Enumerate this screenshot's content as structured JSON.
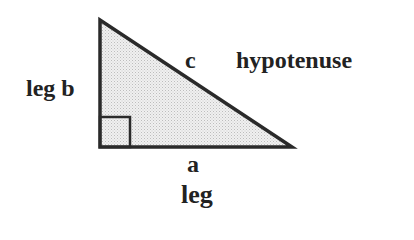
{
  "diagram": {
    "labels": {
      "side_b": "leg b",
      "side_c": "c",
      "hypotenuse": "hypotenuse",
      "side_a": "a",
      "leg": "leg"
    },
    "colors": {
      "stroke": "#2a2a2a",
      "fill": "#e6e6e6",
      "text": "#222222"
    },
    "vertices": {
      "top": [
        100,
        20
      ],
      "right_angle": [
        100,
        147
      ],
      "bottom_right": [
        292,
        147
      ]
    }
  }
}
